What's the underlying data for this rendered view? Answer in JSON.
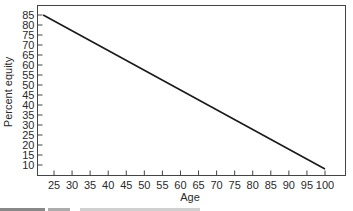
{
  "chart_data": {
    "type": "line",
    "title": "",
    "xlabel": "Age",
    "ylabel": "Percent equity",
    "xlim": [
      20,
      103
    ],
    "ylim": [
      5,
      90
    ],
    "x_ticks": [
      25,
      30,
      35,
      40,
      45,
      50,
      55,
      60,
      65,
      70,
      75,
      80,
      85,
      90,
      95,
      100
    ],
    "y_ticks": [
      10,
      15,
      20,
      25,
      30,
      35,
      40,
      45,
      50,
      55,
      60,
      65,
      70,
      75,
      80,
      85
    ],
    "grid": false,
    "legend": null,
    "series": [
      {
        "name": "Percent equity",
        "x": [
          22,
          100
        ],
        "y": [
          85,
          8
        ],
        "color": "#1a1a1a"
      }
    ]
  },
  "caption": {
    "visible_text": ""
  }
}
